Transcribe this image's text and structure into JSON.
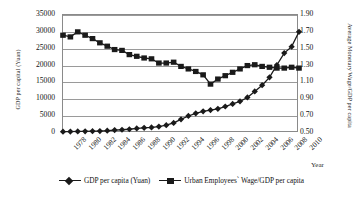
{
  "chart_data": {
    "type": "line",
    "title": "",
    "xlabel": "Year",
    "ylabel": "GDP per capital (Yuan)",
    "y2label": "Average Monetary Wage/GDP per capita",
    "grid": true,
    "legend_position": "bottom",
    "ylim": [
      0,
      35000
    ],
    "y2lim": [
      0.5,
      1.9
    ],
    "yticks": [
      "0",
      "5000",
      "10000",
      "15000",
      "20000",
      "25000",
      "30000",
      "35000"
    ],
    "y2ticks": [
      "0.50",
      "0.70",
      "0.90",
      "1.10",
      "1.30",
      "1.50",
      "1.70",
      "1.90"
    ],
    "x": [
      1978,
      1979,
      1980,
      1981,
      1982,
      1983,
      1984,
      1985,
      1986,
      1987,
      1988,
      1989,
      1990,
      1991,
      1992,
      1993,
      1994,
      1995,
      1996,
      1997,
      1998,
      1999,
      2000,
      2001,
      2002,
      2003,
      2004,
      2005,
      2006,
      2007,
      2008,
      2009,
      2010
    ],
    "xtick_labels": [
      "1978",
      "1980",
      "1982",
      "1984",
      "1986",
      "1988",
      "1990",
      "1992",
      "1994",
      "1996",
      "1998",
      "2000",
      "2002",
      "2004",
      "2006",
      "2008",
      "2010"
    ],
    "series": [
      {
        "name": "GDP per capita (Yuan)",
        "axis": "left",
        "marker": "diamond",
        "color": "#1a1a1a",
        "values": [
          385,
          423,
          468,
          497,
          533,
          582,
          695,
          858,
          963,
          1112,
          1366,
          1519,
          1644,
          1893,
          2311,
          2998,
          4044,
          5046,
          5846,
          6420,
          6796,
          7159,
          7858,
          8622,
          9398,
          10542,
          12336,
          14185,
          16500,
          20169,
          23708,
          25608,
          30015
        ]
      },
      {
        "name": "Urban Employees' Wage/GDP per capita",
        "axis": "right",
        "marker": "square",
        "color": "#1a1a1a",
        "values": [
          1.66,
          1.64,
          1.7,
          1.66,
          1.62,
          1.57,
          1.53,
          1.49,
          1.48,
          1.43,
          1.41,
          1.39,
          1.38,
          1.33,
          1.33,
          1.34,
          1.29,
          1.26,
          1.23,
          1.19,
          1.08,
          1.14,
          1.18,
          1.22,
          1.26,
          1.3,
          1.31,
          1.29,
          1.28,
          1.27,
          1.27,
          1.28,
          1.27
        ]
      }
    ]
  },
  "axis": {
    "x_title": "Year",
    "y_left_title": "GDP per capital (Yuan)",
    "y_right_title": "Average Monetary Wage/GDP per capita"
  },
  "legend": {
    "items": [
      {
        "label": "GDP per capita (Yuan)"
      },
      {
        "label": "Urban Employees` Wage/GDP per capita"
      }
    ]
  }
}
